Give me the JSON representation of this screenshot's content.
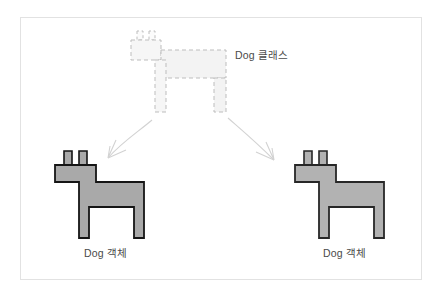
{
  "figure": {
    "title_text": "Dog 클래스",
    "background_color": "#ffffff",
    "frame_color": "#e2e2e2",
    "subject": "Dog"
  },
  "class_node": {
    "label": "Dog 클래스",
    "icon_name": "dashed-dog-outline",
    "style": "dashed",
    "stroke_color": "#b9b9b9",
    "fill_color": "#f5f5f5",
    "dash_pattern": "4 3"
  },
  "objects": [
    {
      "label": "Dog 객체",
      "icon_name": "dog-shape",
      "fill_color": "#a9a9a9",
      "stroke_color": "#1a1a1a",
      "position": "left"
    },
    {
      "label": "Dog 객체",
      "icon_name": "dog-shape",
      "fill_color": "#b2b2b2",
      "stroke_color": "#2a2a2a",
      "position": "right"
    }
  ],
  "arrows": [
    {
      "name": "arrow-class-to-left-object",
      "direction": "down-left",
      "color": "#cfcfcf",
      "from": "class_node",
      "to": "left_object"
    },
    {
      "name": "arrow-class-to-right-object",
      "direction": "down-right",
      "color": "#cfcfcf",
      "from": "class_node",
      "to": "right_object"
    }
  ]
}
